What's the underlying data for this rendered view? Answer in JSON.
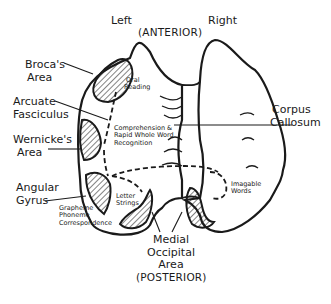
{
  "diagram": {
    "orientation": {
      "left": "Left",
      "right": "Right",
      "top": "(ANTERIOR)",
      "bottom": "(POSTERIOR)"
    },
    "structures": {
      "broca": {
        "line1": "Broca's",
        "line2": "Area"
      },
      "arcuate": {
        "line1": "Arcuate",
        "line2": "Fasciculus"
      },
      "wernicke": {
        "line1": "Wernicke's",
        "line2": "Area"
      },
      "angular": {
        "line1": "Angular",
        "line2": "Gyrus"
      },
      "corpus": {
        "line1": "Corpus",
        "line2": "Callosum"
      },
      "medial_occipital": {
        "line1": "Medial",
        "line2": "Occipital",
        "line3": "Area"
      }
    },
    "functions": {
      "oral_reading": {
        "line1": "Oral",
        "line2": "Reading"
      },
      "comprehension": {
        "line1": "Comprehension &",
        "line2": "Rapid Whole Word",
        "line3": "Recognition"
      },
      "grapheme": {
        "line1": "Grapheme",
        "line2": "Phoneme",
        "line3": "Correspondence"
      },
      "letter_strings": {
        "line1": "Letter",
        "line2": "Strings"
      },
      "imagable_words": {
        "line1": "Imagable",
        "line2": "Words"
      }
    },
    "colors": {
      "ink": "#1a1a1a",
      "background": "#ffffff"
    }
  }
}
